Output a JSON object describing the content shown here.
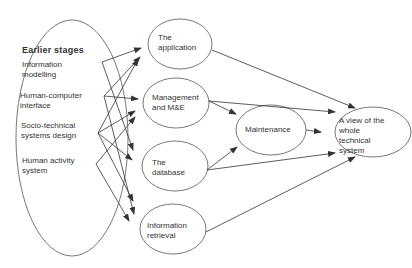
{
  "diagram": {
    "group": {
      "title": "Earlier stages",
      "items": [
        {
          "id": "im",
          "label": [
            "Information",
            "modelling"
          ]
        },
        {
          "id": "hci",
          "label": [
            "Human-computer",
            "interface"
          ]
        },
        {
          "id": "std",
          "label": [
            "Socio-technical",
            "systems design"
          ]
        },
        {
          "id": "has",
          "label": [
            "Human activity",
            "system"
          ]
        }
      ]
    },
    "nodes": [
      {
        "id": "app",
        "label": [
          "The",
          "application"
        ]
      },
      {
        "id": "mgmt",
        "label": [
          "Management",
          "and M&E"
        ]
      },
      {
        "id": "db",
        "label": [
          "The",
          "database"
        ]
      },
      {
        "id": "ir",
        "label": [
          "Information",
          "retrieval"
        ]
      },
      {
        "id": "maint",
        "label": [
          "Maintenance"
        ]
      },
      {
        "id": "view",
        "label": [
          "A view of the",
          "whole",
          "technical",
          "system"
        ]
      }
    ],
    "edges": [
      {
        "from": "im",
        "to": "app"
      },
      {
        "from": "im",
        "to": "db"
      },
      {
        "from": "hci",
        "to": "app"
      },
      {
        "from": "hci",
        "to": "mgmt"
      },
      {
        "from": "hci",
        "to": "ir"
      },
      {
        "from": "std",
        "to": "app"
      },
      {
        "from": "std",
        "to": "mgmt"
      },
      {
        "from": "std",
        "to": "db"
      },
      {
        "from": "std",
        "to": "ir"
      },
      {
        "from": "has",
        "to": "mgmt"
      },
      {
        "from": "has",
        "to": "ir"
      },
      {
        "from": "app",
        "to": "view"
      },
      {
        "from": "mgmt",
        "to": "view"
      },
      {
        "from": "mgmt",
        "to": "maint"
      },
      {
        "from": "db",
        "to": "maint"
      },
      {
        "from": "db",
        "to": "view"
      },
      {
        "from": "maint",
        "to": "view"
      },
      {
        "from": "ir",
        "to": "view"
      }
    ]
  }
}
